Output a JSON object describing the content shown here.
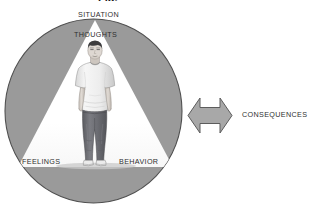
{
  "figure": {
    "type": "cbt-cross-sectional-diagram",
    "title_cropped": "Fig.",
    "background_color": "#ffffff",
    "circle": {
      "name": "outer-circle",
      "fill": "#9a9a9a",
      "stroke": "#4a4a4a",
      "cx": 93.5,
      "cy": 111,
      "rx": 88.5,
      "ry": 92
    },
    "triangle": {
      "name": "inner-triangle",
      "fill": "#ffffff",
      "apex_x": 95,
      "apex_y": 20,
      "base_y": 167,
      "base_left_x": 18,
      "base_right_x": 173
    },
    "arrow": {
      "name": "double-headed-arrow",
      "fill": "#a6a6a6",
      "stroke": "#5c5c5c",
      "direction": "bidirectional-horizontal",
      "x": 188,
      "y": 98,
      "width": 44,
      "height": 35
    },
    "person": {
      "name": "standing-person-illustration",
      "description": "young man standing facing forward, short dark hair, white t-shirt, dark grey jeans, light sneakers",
      "shirt_color": "#f1f1f1",
      "pants_color": "#6e6f74",
      "hair_color": "#3a3a3c",
      "skin_color": "#dcd6d1",
      "shoe_color": "#e8e8e8"
    },
    "labels": {
      "situation": "SITUATION",
      "thoughts": "THOUGHTS",
      "feelings": "FEELINGS",
      "behavior": "BEHAVIOR",
      "consequences": "CONSEQUENCES"
    },
    "label_color": "#2f2f2f"
  }
}
